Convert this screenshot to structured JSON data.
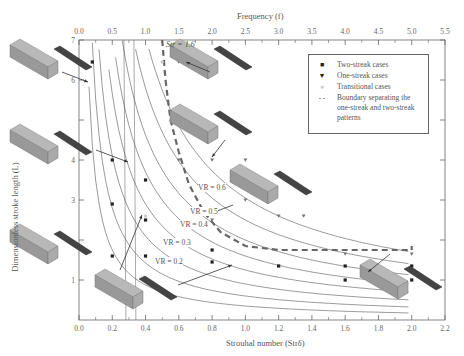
{
  "chart_data": {
    "type": "scatter",
    "title": "",
    "xlabel": "Strouhal number (Str_δ)",
    "ylabel": "Dimensionless stroke length (L)",
    "x2label": "Frequency (f)",
    "xlim": [
      0.0,
      2.2
    ],
    "ylim": [
      0,
      7
    ],
    "x2lim": [
      0.0,
      5.5
    ],
    "xticks": [
      "0.0",
      "0.2",
      "0.4",
      "0.6",
      "0.8",
      "1.0",
      "1.2",
      "1.4",
      "1.6",
      "1.8",
      "2.0",
      "2.2"
    ],
    "yticks": [
      "1",
      "2",
      "3",
      "4",
      "5",
      "6",
      "7"
    ],
    "yticks_visible": [
      "1",
      "3",
      "4",
      "6",
      "7"
    ],
    "x2ticks": [
      "0.0",
      "0.5",
      "1.0",
      "1.5",
      "2.0",
      "2.5",
      "3.0",
      "3.5",
      "4.0",
      "4.5",
      "5.0",
      "5.5"
    ],
    "grid": false,
    "legend_position": "upper right",
    "legend": [
      {
        "label": "Two-streak cases",
        "marker": "square"
      },
      {
        "label": "One-streak cases",
        "marker": "triangle-down"
      },
      {
        "label": "Transitional cases",
        "marker": "circle-light"
      },
      {
        "label": "Boundary separating the one-streak and two-streak patterns",
        "marker": "dashed-line"
      }
    ],
    "series": [
      {
        "name": "Two-streak cases",
        "marker": "square",
        "points": [
          [
            0.08,
            6.45
          ],
          [
            0.2,
            4.0
          ],
          [
            0.2,
            2.9
          ],
          [
            0.2,
            1.6
          ],
          [
            0.4,
            3.5
          ],
          [
            0.4,
            2.5
          ],
          [
            0.4,
            1.6
          ],
          [
            0.8,
            1.75
          ],
          [
            0.8,
            1.45
          ],
          [
            1.2,
            1.35
          ],
          [
            1.6,
            1.35
          ],
          [
            1.6,
            1.0
          ],
          [
            2.0,
            1.35
          ],
          [
            2.0,
            1.0
          ]
        ]
      },
      {
        "name": "One-streak cases",
        "marker": "triangle-down",
        "points": [
          [
            0.6,
            6.45
          ],
          [
            0.8,
            6.45
          ],
          [
            0.6,
            4.0
          ],
          [
            0.8,
            4.0
          ],
          [
            1.0,
            4.0
          ],
          [
            1.0,
            3.0
          ],
          [
            0.8,
            2.5
          ],
          [
            1.2,
            2.6
          ],
          [
            1.35,
            2.6
          ],
          [
            2.0,
            1.65
          ],
          [
            1.6,
            1.65
          ]
        ]
      },
      {
        "name": "Transitional cases",
        "marker": "circle-light",
        "points": [
          [
            0.5,
            6.45
          ],
          [
            0.4,
            2.6
          ]
        ]
      }
    ],
    "boundary": {
      "name": "Boundary separating the one-streak and two-streak patterns",
      "style": "dashed",
      "points": [
        [
          0.5,
          7.0
        ],
        [
          0.52,
          6.0
        ],
        [
          0.55,
          5.0
        ],
        [
          0.6,
          4.2
        ],
        [
          0.66,
          3.4
        ],
        [
          0.75,
          2.7
        ],
        [
          0.85,
          2.2
        ],
        [
          1.0,
          1.85
        ],
        [
          1.2,
          1.75
        ],
        [
          1.6,
          1.75
        ],
        [
          2.0,
          1.75
        ],
        [
          2.0,
          1.85
        ]
      ]
    },
    "iso_curves": [
      {
        "label": "VR = 0.2",
        "label_pos": [
          0.45,
          1.65
        ]
      },
      {
        "label": "VR = 0.3",
        "label_pos": [
          0.5,
          2.25
        ]
      },
      {
        "label": "VR = 0.4",
        "label_pos": [
          0.6,
          2.6
        ]
      },
      {
        "label": "VR = 0.5",
        "label_pos": [
          0.7,
          2.85
        ]
      },
      {
        "label": "VR = 0.6",
        "label_pos": [
          0.75,
          3.45
        ]
      }
    ],
    "annotations": [
      {
        "text": "Str = 1.6",
        "x": 1.08,
        "y": 6.9
      }
    ]
  },
  "labels": {
    "x2_title": "Frequency (f)",
    "x_title": "Strouhal number (Strδ)",
    "y_title": "Dimensionless stroke length (L)",
    "str_annotation": "Str = 1.6",
    "vr": [
      "VR = 0.6",
      "VR = 0.5",
      "VR = 0.4",
      "VR = 0.3",
      "VR = 0.2"
    ],
    "legend": [
      "Two-streak cases",
      "One-streak cases",
      "Transitional cases",
      "Boundary separating the one-streak and two-streak patterns"
    ]
  },
  "colors": {
    "axis": "#666666",
    "curve": "#555555",
    "boundary": "#666666",
    "marker": "#222222"
  }
}
